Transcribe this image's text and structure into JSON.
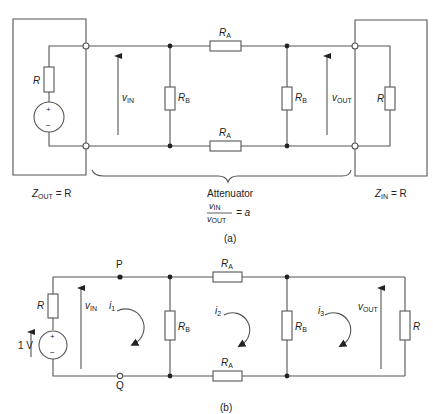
{
  "figure_a": {
    "caption": "(a)",
    "source_resistor": "R",
    "source_plus": "+",
    "source_minus": "−",
    "v_in": {
      "main": "v",
      "sub": "IN"
    },
    "v_out": {
      "main": "v",
      "sub": "OUT"
    },
    "rb_left": {
      "main": "R",
      "sub": "B"
    },
    "rb_right": {
      "main": "R",
      "sub": "B"
    },
    "ra_top": {
      "main": "R",
      "sub": "A"
    },
    "ra_bottom": {
      "main": "R",
      "sub": "A"
    },
    "load_resistor": "R",
    "zout": {
      "main": "Z",
      "sub": "OUT",
      "rest": " = R"
    },
    "zin": {
      "main": "Z",
      "sub": "IN",
      "rest": " = R"
    },
    "attenuator_label": "Attenuator",
    "ratio": {
      "num_main": "v",
      "num_sub": "IN",
      "den_main": "v",
      "den_sub": "OUT",
      "rest": "= a"
    }
  },
  "figure_b": {
    "caption": "(b)",
    "source_resistor": "R",
    "source_voltage": "1 V",
    "source_plus": "+",
    "source_minus": "−",
    "node_p": "P",
    "node_q": "Q",
    "v_in": {
      "main": "v",
      "sub": "IN"
    },
    "v_out": {
      "main": "v",
      "sub": "OUT"
    },
    "i1": {
      "main": "i",
      "sub": "1"
    },
    "i2": {
      "main": "i",
      "sub": "2"
    },
    "i3": {
      "main": "i",
      "sub": "3"
    },
    "rb_left": {
      "main": "R",
      "sub": "B"
    },
    "rb_right": {
      "main": "R",
      "sub": "B"
    },
    "ra_top": {
      "main": "R",
      "sub": "A"
    },
    "ra_bottom": {
      "main": "R",
      "sub": "A"
    },
    "load_resistor": "R"
  }
}
